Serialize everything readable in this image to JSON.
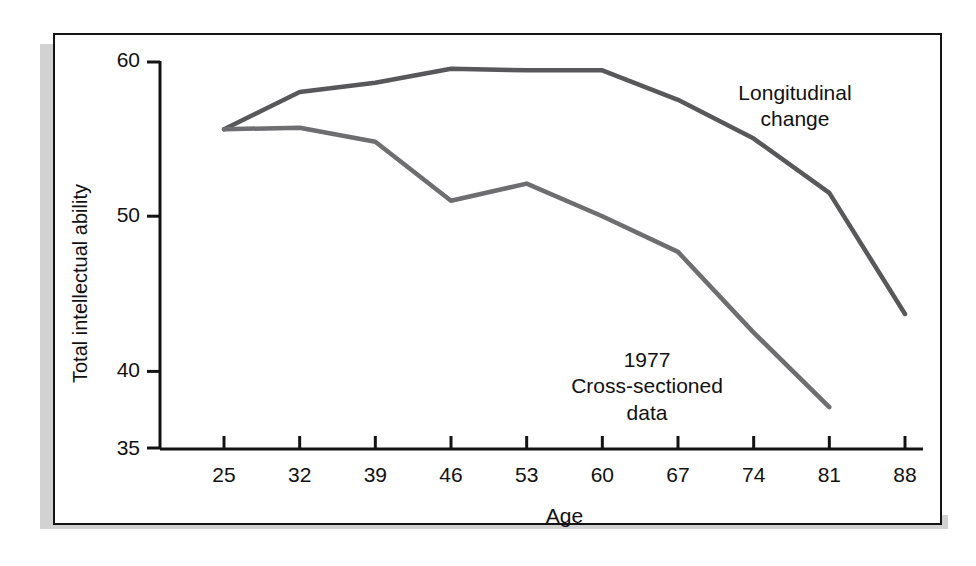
{
  "figure": {
    "background_color": "#ffffff",
    "frame_color": "#141414",
    "shadow_color": "#d2d2d2"
  },
  "chart_data": {
    "type": "line",
    "title": "",
    "xlabel": "Age",
    "ylabel": "Total intellectual ability",
    "x": [
      25,
      32,
      39,
      46,
      53,
      60,
      67,
      74,
      81,
      88
    ],
    "xticklabels": [
      "25",
      "32",
      "39",
      "46",
      "53",
      "60",
      "67",
      "74",
      "81",
      "88"
    ],
    "xlim": [
      21.5,
      91.5
    ],
    "yticks": [
      35,
      40,
      50,
      60
    ],
    "yticklabels": [
      "35",
      "40",
      "50",
      "60"
    ],
    "ylim": [
      35,
      60
    ],
    "grid": false,
    "legend_position": "inline-annotation",
    "series": [
      {
        "name": "Longitudinal change",
        "color": "#58585a",
        "values": [
          55.6,
          58.0,
          58.6,
          59.5,
          59.4,
          59.4,
          57.5,
          55.0,
          51.5,
          43.7
        ]
      },
      {
        "name": "1977 Cross-sectioned data",
        "color": "#6e6e70",
        "values": [
          55.6,
          55.7,
          54.8,
          51.0,
          52.1,
          50.0,
          47.7,
          42.5,
          37.7,
          null
        ]
      }
    ],
    "annotations": [
      {
        "id": "longitudinal-label",
        "text": "Longitudinal\nchange",
        "x_px": 793,
        "y_px": 78
      },
      {
        "id": "cross-sectioned-label",
        "text": "1977\nCross-sectioned\ndata",
        "x_px": 645,
        "y_px": 345
      }
    ]
  }
}
